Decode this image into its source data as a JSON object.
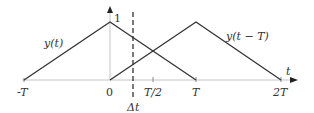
{
  "diagram": {
    "colors": {
      "axis": "#bbbbbb",
      "curve": "#333333",
      "text": "#333333"
    },
    "axis": {
      "x_label": "t",
      "ticks": [
        {
          "label": "-T",
          "x": 24
        },
        {
          "label": "0",
          "x": 110
        },
        {
          "label": "T/2",
          "x": 153
        },
        {
          "label": "T",
          "x": 196
        },
        {
          "label": "2T",
          "x": 281
        }
      ],
      "peak_label": "1"
    },
    "curves": [
      {
        "label": "y(t)",
        "points": [
          [
            -1,
            0
          ],
          [
            0,
            1
          ],
          [
            1,
            0
          ]
        ]
      },
      {
        "label": "y(t − T)",
        "points": [
          [
            0,
            0
          ],
          [
            1,
            1
          ],
          [
            2,
            0
          ]
        ]
      }
    ],
    "marker": {
      "label": "Δt",
      "style": "dashed"
    }
  }
}
